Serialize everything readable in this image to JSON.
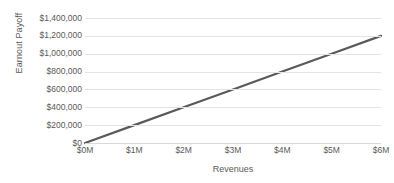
{
  "chart_data": {
    "type": "line",
    "title": "",
    "xlabel": "Revenues",
    "ylabel": "Earnout Payoff",
    "x": [
      0,
      1000000,
      2000000,
      3000000,
      4000000,
      5000000,
      6000000
    ],
    "series": [
      {
        "name": "Earnout Payoff",
        "color": "#595959",
        "values": [
          0,
          200000,
          400000,
          600000,
          800000,
          1000000,
          1200000
        ]
      }
    ],
    "xlim": [
      0,
      6000000
    ],
    "ylim": [
      0,
      1400000
    ],
    "x_tick_values": [
      0,
      1000000,
      2000000,
      3000000,
      4000000,
      5000000,
      6000000
    ],
    "x_tick_labels": [
      "$0M",
      "$1M",
      "$2M",
      "$3M",
      "$4M",
      "$5M",
      "$6M"
    ],
    "y_tick_values": [
      0,
      200000,
      400000,
      600000,
      800000,
      1000000,
      1200000,
      1400000
    ],
    "y_tick_labels": [
      "$0",
      "$200,000",
      "$400,000",
      "$600,000",
      "$800,000",
      "$1,000,000",
      "$1,200,000",
      "$1,400,000"
    ],
    "grid": true,
    "grid_color": "#e3e3e3",
    "legend": "none",
    "background": "#ffffff",
    "text_color": "#595959"
  }
}
